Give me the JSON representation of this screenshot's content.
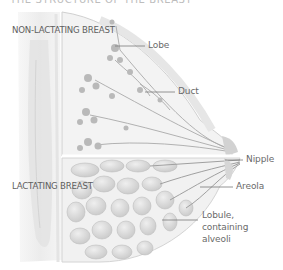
{
  "diagram": {
    "title": "THE STRUCTURE OF THE BREAST",
    "sections": [
      {
        "label": "NON-LACTATING BREAST"
      },
      {
        "label": "LACTATING BREAST"
      }
    ],
    "labels": [
      {
        "text": "Lobe"
      },
      {
        "text": "Duct"
      },
      {
        "text": "Nipple"
      },
      {
        "text": "Areola"
      },
      {
        "text": "Lobule, containing alveoli"
      }
    ],
    "colors": {
      "background": "#ffffff",
      "tissue": "#e9e9e9",
      "structure": "#b5b5b5",
      "lines": "#8a8a8a",
      "text": "#666666"
    }
  }
}
